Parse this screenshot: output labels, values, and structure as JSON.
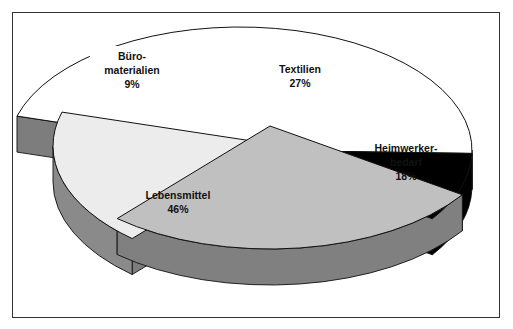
{
  "chart_data": {
    "type": "pie",
    "variant": "3d-exploded",
    "title": "",
    "slices": [
      {
        "label_lines": [
          "Lebensmittel"
        ],
        "label": "Lebensmittel",
        "value": 46,
        "value_label": "46%",
        "color": "#ffffff",
        "side_color": "#8a8a8a",
        "exploded": false,
        "label_box": false
      },
      {
        "label_lines": [
          "Büro-",
          "materialien"
        ],
        "label": "Büromaterialien",
        "value": 9,
        "value_label": "9%",
        "color": "#000000",
        "side_color": "#000000",
        "exploded": false,
        "label_box": true
      },
      {
        "label_lines": [
          "Textilien"
        ],
        "label": "Textilien",
        "value": 27,
        "value_label": "27%",
        "color": "#c0c0c0",
        "side_color": "#808080",
        "exploded": true,
        "label_box": true
      },
      {
        "label_lines": [
          "Heimwerker-",
          "bedarf"
        ],
        "label": "Heimwerkerbedarf",
        "value": 18,
        "value_label": "18%",
        "color": "#ececec",
        "side_color": "#8a8a8a",
        "exploded": true,
        "label_box": false
      }
    ],
    "legend": "none",
    "units": "percent"
  }
}
